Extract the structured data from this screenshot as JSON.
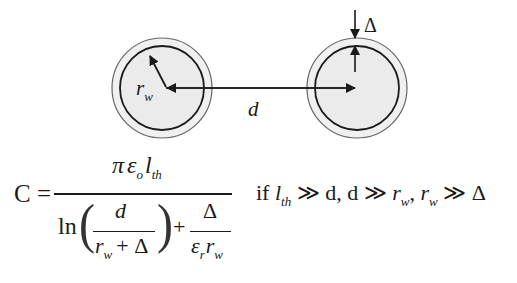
{
  "diagram": {
    "type": "two-wire capacitance cross-section",
    "labels": {
      "wire_radius": "r",
      "wire_radius_sub": "w",
      "distance": "d",
      "insulation_thickness": "Δ"
    },
    "colors": {
      "line": "#1a1a1a",
      "fill": "#ececec",
      "outer_ring": "#555555"
    }
  },
  "formula": {
    "lhs": "C =",
    "numerator": {
      "pi": "π",
      "epsilon": "ε",
      "epsilon_sub": "o",
      "l": "l",
      "l_sub": "th"
    },
    "denominator": {
      "ln": "ln",
      "frac1_num": "d",
      "frac1_den_r": "r",
      "frac1_den_sub": "w",
      "frac1_den_rest": "+ Δ",
      "plus": "+",
      "frac2_num": "Δ",
      "frac2_den_eps": "ε",
      "frac2_den_eps_sub": "r",
      "frac2_den_r": "r",
      "frac2_den_r_sub": "w"
    },
    "condition": {
      "if": "if",
      "l": "l",
      "l_sub": "th",
      "c1_rest": "≫ d, d ≫",
      "r1": "r",
      "r1_sub": "w",
      "comma": ",",
      "r2": "r",
      "r2_sub": "w",
      "c3_rest": "≫ Δ"
    }
  }
}
